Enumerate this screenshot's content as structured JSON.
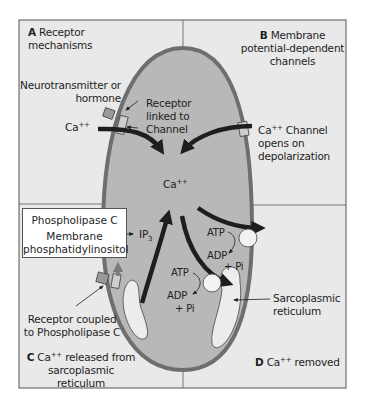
{
  "figure": {
    "colors": {
      "background_panel": "#e9e9e9",
      "cell_cytoplasm": "#b8b8b8",
      "membrane": "#6e6e6e",
      "sarcoplasmic_reticulum": "#ececec",
      "arrows": "#1e1e1e",
      "frame": "#555555"
    }
  },
  "quadrants": {
    "A": {
      "letter": "A",
      "title_line1": "Receptor",
      "title_line2": "mechanisms"
    },
    "B": {
      "letter": "B",
      "title_line1": "Membrane",
      "title_line2": "potential-dependent",
      "title_line3": "channels"
    },
    "C": {
      "letter": "C",
      "ion": "Ca",
      "charge": "++",
      "title_rest": "released from",
      "title_line2": "sarcoplasmic",
      "title_line3": "reticulum"
    },
    "D": {
      "letter": "D",
      "ion": "Ca",
      "charge": "++",
      "title_rest": "removed"
    }
  },
  "labels": {
    "neurotransmitter_line1": "Neurotransmitter or",
    "neurotransmitter_line2": "hormone",
    "receptor_linked_line1": "Receptor",
    "receptor_linked_line2": "linked to",
    "receptor_linked_line3": "Channel",
    "ca_outside_left": {
      "ion": "Ca",
      "charge": "++"
    },
    "ca_channel_line1_ion": "Ca",
    "ca_channel_line1_charge": "++",
    "ca_channel_line1_rest": "Channel",
    "ca_channel_line2": "opens on",
    "ca_channel_line3": "depolarization",
    "ca_center": {
      "ion": "Ca",
      "charge": "++"
    },
    "phospholipase_box": {
      "line1": "Phospholipase C",
      "line2": "Membrane",
      "line3": "phosphatidylinositol"
    },
    "ip3": {
      "base": "IP",
      "sub": "3"
    },
    "pump_right": {
      "atp": "ATP",
      "adp": "ADP",
      "pi": "+ Pi"
    },
    "pump_inner": {
      "atp": "ATP",
      "adp": "ADP",
      "pi": "+ Pi"
    },
    "sarcoplasmic_line1": "Sarcoplasmic",
    "sarcoplasmic_line2": "reticulum",
    "receptor_coupled_line1": "Receptor coupled",
    "receptor_coupled_line2": "to Phospholipase C"
  }
}
